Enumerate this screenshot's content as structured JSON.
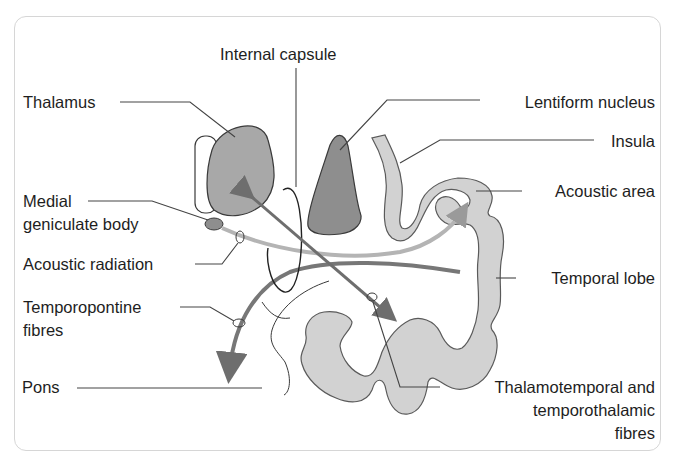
{
  "diagram": {
    "labels": {
      "internal_capsule": "Internal capsule",
      "thalamus": "Thalamus",
      "lentiform_nucleus": "Lentiform nucleus",
      "insula": "Insula",
      "medial_geniculate_line1": "Medial",
      "medial_geniculate_line2": "geniculate body",
      "acoustic_area": "Acoustic area",
      "acoustic_radiation": "Acoustic radiation",
      "temporal_lobe": "Temporal lobe",
      "temporopontine_line1": "Temporopontine",
      "temporopontine_line2": "fibres",
      "pons": "Pons",
      "thalamotemporal_line1": "Thalamotemporal and",
      "thalamotemporal_line2": "temporothalamic",
      "thalamotemporal_line3": "fibres"
    },
    "colors": {
      "thalamus_fill": "#a8a8a8",
      "lentiform_fill": "#8e8e8e",
      "cortex_fill": "#d2d2d2",
      "tract_light": "#b4b4b4",
      "tract_dark": "#777777",
      "outline": "#3a3a3a",
      "leader_line": "#444444",
      "frame_border": "#d6d6d6"
    }
  }
}
